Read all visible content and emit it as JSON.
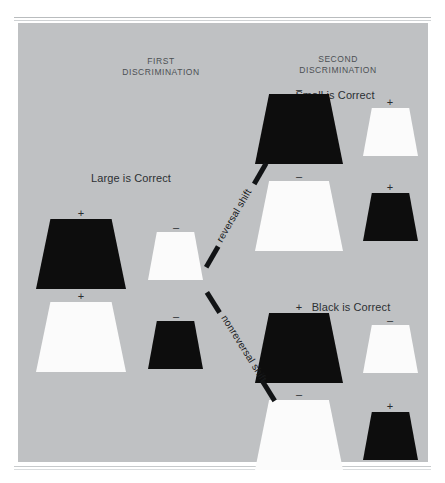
{
  "figure": {
    "background_color": "#bfc1c3",
    "page_color": "#ffffff",
    "ink_color": "#0d0d0d"
  },
  "columns": {
    "first": {
      "title": "FIRST\nDISCRIMINATION"
    },
    "second": {
      "title": "SECOND\nDISCRIMINATION"
    }
  },
  "groups": {
    "first_discrimination": {
      "rule_label": "Large is Correct"
    },
    "reversal_outcome": {
      "rule_label": "Small is Correct"
    },
    "nonreversal_outcome": {
      "rule_label": "Black is Correct"
    }
  },
  "arrows": {
    "reversal": {
      "label": "reversal shift"
    },
    "nonreversal": {
      "label": "nonreversal shift"
    }
  },
  "signs": {
    "positive": "+",
    "negative": "–"
  },
  "stimuli": [
    {
      "group": "first_discrimination",
      "row": 1,
      "position": "left",
      "size": "large",
      "color": "black",
      "sign": "+"
    },
    {
      "group": "first_discrimination",
      "row": 1,
      "position": "right",
      "size": "small",
      "color": "white",
      "sign": "–"
    },
    {
      "group": "first_discrimination",
      "row": 2,
      "position": "left",
      "size": "large",
      "color": "white",
      "sign": "+"
    },
    {
      "group": "first_discrimination",
      "row": 2,
      "position": "right",
      "size": "small",
      "color": "black",
      "sign": "–"
    },
    {
      "group": "reversal_outcome",
      "row": 1,
      "position": "left",
      "size": "large",
      "color": "black",
      "sign": "–"
    },
    {
      "group": "reversal_outcome",
      "row": 1,
      "position": "right",
      "size": "small",
      "color": "white",
      "sign": "+"
    },
    {
      "group": "reversal_outcome",
      "row": 2,
      "position": "left",
      "size": "large",
      "color": "white",
      "sign": "–"
    },
    {
      "group": "reversal_outcome",
      "row": 2,
      "position": "right",
      "size": "small",
      "color": "black",
      "sign": "+"
    },
    {
      "group": "nonreversal_outcome",
      "row": 1,
      "position": "left",
      "size": "large",
      "color": "black",
      "sign": "+"
    },
    {
      "group": "nonreversal_outcome",
      "row": 1,
      "position": "right",
      "size": "small",
      "color": "white",
      "sign": "–"
    },
    {
      "group": "nonreversal_outcome",
      "row": 2,
      "position": "left",
      "size": "large",
      "color": "white",
      "sign": "–"
    },
    {
      "group": "nonreversal_outcome",
      "row": 2,
      "position": "right",
      "size": "small",
      "color": "black",
      "sign": "+"
    }
  ]
}
